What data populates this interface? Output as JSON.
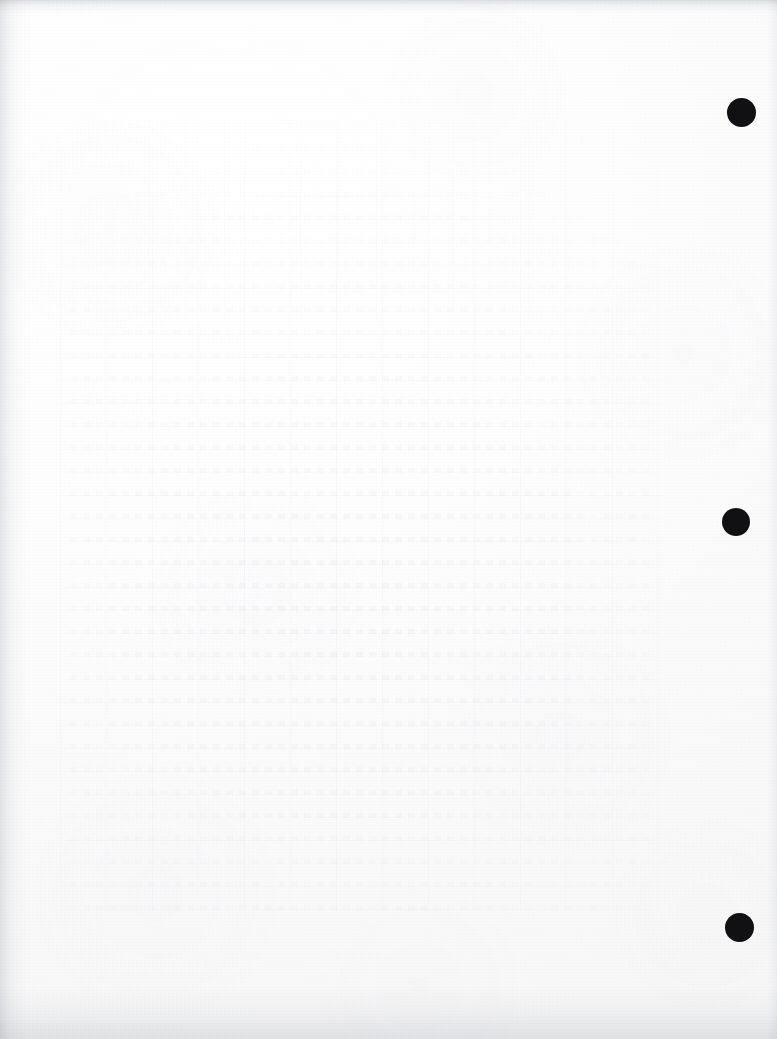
{
  "page": {
    "kind": "scanned-blank-page",
    "width": 777,
    "height": 1039,
    "paper_color": "#fcfcfd",
    "visible_text": ""
  },
  "marks": {
    "label": "binding-punch-marks",
    "color": "#111114",
    "count": 3,
    "items": [
      {
        "name": "punch-mark-top",
        "cx": 741,
        "cy": 112,
        "d": 29
      },
      {
        "name": "punch-mark-middle",
        "cx": 736,
        "cy": 522,
        "d": 28
      },
      {
        "name": "punch-mark-bottom",
        "cx": 739,
        "cy": 927,
        "d": 29
      }
    ]
  },
  "showthrough": {
    "label": "reverse-side-bleed-through",
    "content_type": "table-grid",
    "ink_color": "#606878"
  },
  "edges": {
    "shadow_color": "#969aa2",
    "top": true,
    "left": true,
    "bottom": true,
    "right": true
  }
}
